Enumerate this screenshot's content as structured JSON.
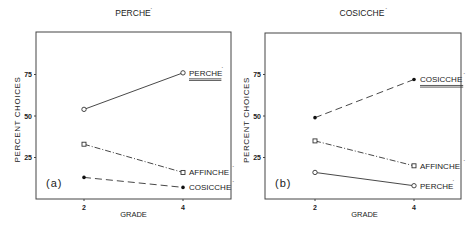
{
  "chart_data": [
    {
      "type": "line",
      "title": "PERCHE'",
      "panel_label": "(a)",
      "xlabel": "GRADE",
      "ylabel": "PERCENT CHOICES",
      "x": [
        2,
        4
      ],
      "xticks": [
        "2",
        "4"
      ],
      "yticks": [
        "25",
        "50",
        "75"
      ],
      "ylim": [
        0,
        95
      ],
      "grid": false,
      "series": [
        {
          "name": "PERCHE'",
          "values": [
            54,
            76
          ],
          "marker": "open-circle",
          "line": "solid",
          "underlined": true
        },
        {
          "name": "AFFINCHE'",
          "values": [
            33,
            16
          ],
          "marker": "open-square",
          "line": "dash-dot"
        },
        {
          "name": "COSICCHE'",
          "values": [
            13,
            7
          ],
          "marker": "filled-circle",
          "line": "dashed"
        }
      ]
    },
    {
      "type": "line",
      "title": "COSICCHE'",
      "panel_label": "(b)",
      "xlabel": "GRADE",
      "ylabel": "PERCENT CHOICES",
      "x": [
        2,
        4
      ],
      "xticks": [
        "2",
        "4"
      ],
      "yticks": [
        "25",
        "50",
        "75"
      ],
      "ylim": [
        0,
        95
      ],
      "grid": false,
      "series": [
        {
          "name": "COSICCHE'",
          "values": [
            49,
            72
          ],
          "marker": "filled-circle",
          "line": "dashed",
          "underlined": true
        },
        {
          "name": "AFFINCHE'",
          "values": [
            35,
            20
          ],
          "marker": "open-square",
          "line": "dash-dot"
        },
        {
          "name": "PERCHE'",
          "values": [
            16,
            8
          ],
          "marker": "open-circle",
          "line": "solid"
        }
      ]
    }
  ]
}
